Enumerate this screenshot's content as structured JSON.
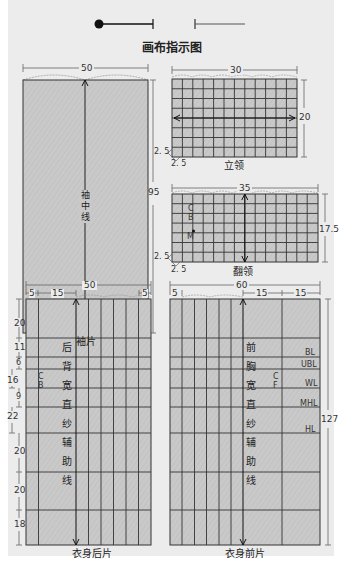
{
  "header": {
    "title": "画布指示图",
    "legend_icons": [
      "needle-pin-icon",
      "thread-line-icon"
    ]
  },
  "colors": {
    "panel_bg": "#ececec",
    "fabric_fill": "#c8c8c8",
    "grid_line": "#333333",
    "dim_line": "#666666",
    "edge_wavy": "#999999"
  },
  "pieces": {
    "sleeve": {
      "caption": "袖片",
      "width_label": "50",
      "height_label": "95",
      "center_line_label": [
        "袖",
        "中",
        "线"
      ]
    },
    "stand_collar": {
      "caption": "立领",
      "width_label": "30",
      "height_label": "20",
      "margin_left_label": "2. 5",
      "margin_bottom_label": "2. 5"
    },
    "turn_collar": {
      "caption": "翻领",
      "width_label": "35",
      "height_label": "17.5",
      "margin_left_label": "2. 5",
      "margin_bottom_label": "2. 5",
      "markers": [
        "C",
        "B",
        "M"
      ]
    },
    "back_body": {
      "caption": "衣身后片",
      "width_label": "50",
      "top_segments": [
        "5",
        "15",
        "5"
      ],
      "side_segments": [
        "20",
        "11",
        "6",
        "16",
        "9",
        "22",
        "20",
        "20",
        "18"
      ],
      "center_line_label": [
        "后",
        "背",
        "宽",
        "直",
        "纱",
        "辅",
        "助",
        "线"
      ],
      "marker": [
        "C",
        "B"
      ]
    },
    "front_body": {
      "caption": "衣身前片",
      "width_label": "60",
      "top_segments": [
        "5",
        "15",
        "15"
      ],
      "height_label": "127",
      "center_line_label": [
        "前",
        "胸",
        "宽",
        "直",
        "纱",
        "辅",
        "助",
        "线"
      ],
      "marker": [
        "C",
        "F"
      ],
      "line_labels": [
        "BL",
        "UBL",
        "WL",
        "MHL",
        "HL"
      ]
    }
  }
}
